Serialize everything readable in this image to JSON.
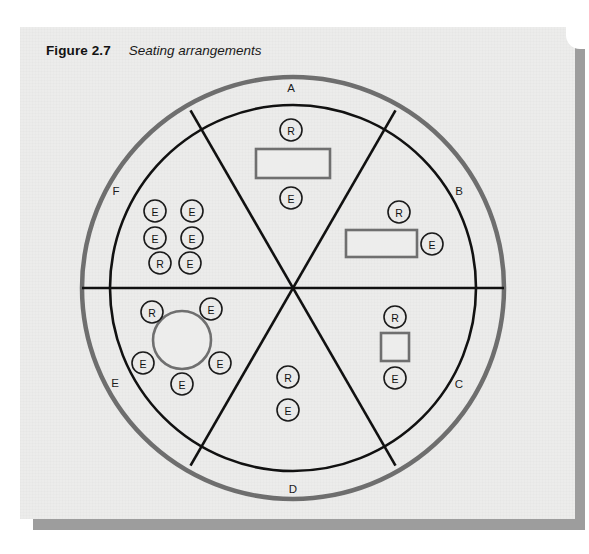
{
  "figure": {
    "label": "Figure 2.7",
    "title": "Seating arrangements"
  },
  "colors": {
    "card_background": "#ececeb",
    "outer_ring": "#6e6e6e",
    "inner_circle": "#111111",
    "divider_line": "#111111",
    "table_stroke": "#6f6f6f",
    "table_fill": "#ededec",
    "seat_stroke": "#1a1a1a",
    "text": "#121212",
    "shadow": "#9d9d9d"
  },
  "diagram": {
    "type": "seating-plan-wheel",
    "center": {
      "x": 293,
      "y": 288
    },
    "outer_ring_radius": 211,
    "inner_circle_radius": 183,
    "sector_count": 6,
    "sector_labels": [
      {
        "id": "A",
        "label": "A",
        "x": 291,
        "y": 89
      },
      {
        "id": "B",
        "label": "B",
        "x": 459,
        "y": 192
      },
      {
        "id": "C",
        "label": "C",
        "x": 459,
        "y": 385
      },
      {
        "id": "D",
        "label": "D",
        "x": 293,
        "y": 490
      },
      {
        "id": "E",
        "label": "E",
        "x": 115,
        "y": 384
      },
      {
        "id": "F",
        "label": "F",
        "x": 116,
        "y": 192
      }
    ],
    "sectors": [
      {
        "id": "A",
        "name": "sector-a",
        "table": {
          "shape": "rectangle",
          "x": 256,
          "y": 149,
          "width": 74,
          "height": 29
        },
        "seats": [
          {
            "role": "R",
            "x": 291,
            "y": 130
          },
          {
            "role": "E",
            "x": 291,
            "y": 198
          }
        ]
      },
      {
        "id": "B",
        "name": "sector-b",
        "table": {
          "shape": "rectangle",
          "x": 346,
          "y": 230,
          "width": 71,
          "height": 27
        },
        "seats": [
          {
            "role": "R",
            "x": 399,
            "y": 212
          },
          {
            "role": "E",
            "x": 432,
            "y": 244
          }
        ]
      },
      {
        "id": "C",
        "name": "sector-c",
        "table": {
          "shape": "square",
          "x": 381,
          "y": 333,
          "width": 28,
          "height": 28
        },
        "seats": [
          {
            "role": "R",
            "x": 395,
            "y": 317
          },
          {
            "role": "E",
            "x": 395,
            "y": 378
          }
        ]
      },
      {
        "id": "D",
        "name": "sector-d",
        "table": null,
        "seats": [
          {
            "role": "R",
            "x": 288,
            "y": 377
          },
          {
            "role": "E",
            "x": 288,
            "y": 410
          }
        ]
      },
      {
        "id": "E",
        "name": "sector-e",
        "table": {
          "shape": "circle",
          "cx": 182,
          "cy": 340,
          "r": 29
        },
        "seats": [
          {
            "role": "R",
            "x": 152,
            "y": 312
          },
          {
            "role": "E",
            "x": 211,
            "y": 309
          },
          {
            "role": "E",
            "x": 143,
            "y": 363
          },
          {
            "role": "E",
            "x": 220,
            "y": 363
          },
          {
            "role": "E",
            "x": 182,
            "y": 384
          }
        ]
      },
      {
        "id": "F",
        "name": "sector-f",
        "table": null,
        "seats": [
          {
            "role": "E",
            "x": 155,
            "y": 211
          },
          {
            "role": "E",
            "x": 192,
            "y": 211
          },
          {
            "role": "E",
            "x": 155,
            "y": 238
          },
          {
            "role": "E",
            "x": 192,
            "y": 238
          },
          {
            "role": "R",
            "x": 160,
            "y": 263
          },
          {
            "role": "E",
            "x": 190,
            "y": 263
          }
        ]
      }
    ],
    "legend_keys": [
      {
        "code": "R",
        "meaning": "R"
      },
      {
        "code": "E",
        "meaning": "E"
      }
    ],
    "seat_radius": 11
  }
}
